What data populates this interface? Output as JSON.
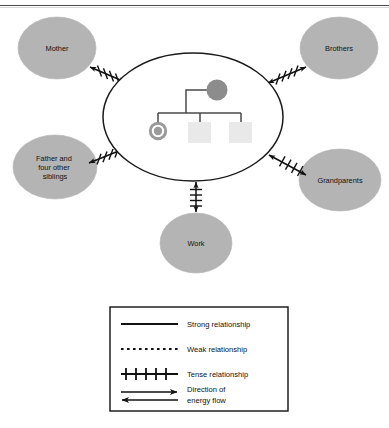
{
  "figure": {
    "type": "ecomap",
    "title": "",
    "colors": {
      "satellite_fill": "#b4b4b4",
      "satellite_stroke": "#b4b4b4",
      "household_stroke": "#1a1a1a",
      "person_circle_fill": "#8c8c8c",
      "index_ring_fill": "#9a9a9a",
      "index_inner_fill": "#9a9a9a",
      "child_square_fill": "#e9e9e9",
      "connector_stroke": "#4a4a4a",
      "line_color": "#111111",
      "page_background": "#ffffff",
      "rule_color": "#4a4a4a"
    },
    "household": {
      "name": "household-ellipse",
      "members": [
        {
          "id": "mother",
          "symbol": "filled-circle",
          "label": ""
        },
        {
          "id": "index-child",
          "symbol": "double-circle",
          "label": ""
        },
        {
          "id": "child-2",
          "symbol": "square",
          "label": ""
        },
        {
          "id": "child-3",
          "symbol": "square",
          "label": ""
        }
      ]
    },
    "satellites": [
      {
        "id": "mother",
        "label_lines": [
          "Mother"
        ],
        "position": "top-left",
        "link_type": "tense",
        "link_arrow": "double"
      },
      {
        "id": "brothers",
        "label_lines": [
          "Brothers"
        ],
        "position": "top-right",
        "link_type": "tense",
        "link_arrow": "double"
      },
      {
        "id": "father-and-siblings",
        "label_lines": [
          "Father and",
          "four other",
          "siblings"
        ],
        "position": "bottom-left",
        "link_type": "tense",
        "link_arrow": "double"
      },
      {
        "id": "grandparents",
        "label_lines": [
          "Grandparents"
        ],
        "position": "bottom-right",
        "link_type": "tense",
        "link_arrow": "double"
      },
      {
        "id": "work",
        "label_lines": [
          "Work"
        ],
        "position": "bottom-center",
        "link_type": "tense",
        "link_arrow": "double"
      }
    ]
  },
  "legend": {
    "name": "legend-box",
    "items": [
      {
        "id": "strong",
        "sample": "solid-line",
        "label_lines": [
          "Strong relationship"
        ]
      },
      {
        "id": "weak",
        "sample": "dotted-line",
        "label_lines": [
          "Weak relationship"
        ]
      },
      {
        "id": "tense",
        "sample": "hatched-line",
        "label_lines": [
          "Tense relationship"
        ]
      },
      {
        "id": "energy",
        "sample": "double-arrow",
        "label_lines": [
          "Direction of",
          "energy flow"
        ]
      }
    ]
  }
}
